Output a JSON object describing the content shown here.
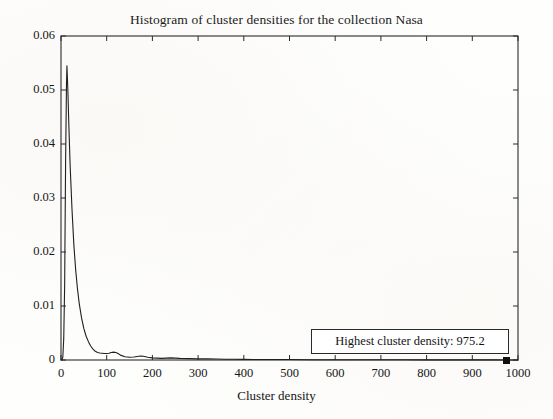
{
  "figure": {
    "title": "Histogram of cluster densities for the collection Nasa",
    "background_color": "#ffffff",
    "axis_color": "#2a2a2a",
    "curve_color": "#1f1f1f"
  },
  "annotation": {
    "text": "Highest cluster density: 975.2",
    "marker_name": "highest-density-marker",
    "marker_x": 975.2,
    "marker_y": 0
  },
  "axes": {
    "x": {
      "label": "Cluster density",
      "min": 0,
      "max": 1000,
      "ticks": [
        0,
        100,
        200,
        300,
        400,
        500,
        600,
        700,
        800,
        900,
        1000
      ],
      "tick_labels": [
        "0",
        "100",
        "200",
        "300",
        "400",
        "500",
        "600",
        "700",
        "800",
        "900",
        "1000"
      ]
    },
    "y": {
      "label": "",
      "min": 0,
      "max": 0.06,
      "ticks": [
        0,
        0.01,
        0.02,
        0.03,
        0.04,
        0.05,
        0.06
      ],
      "tick_labels": [
        "0",
        "0.01",
        "0.02",
        "0.03",
        "0.04",
        "0.05",
        "0.06"
      ]
    },
    "grid": false,
    "legend": "none"
  },
  "chart_data": {
    "type": "line",
    "title": "Histogram of cluster densities for the collection Nasa",
    "xlabel": "Cluster density",
    "ylabel": "",
    "xlim": [
      0,
      1000
    ],
    "ylim": [
      0,
      0.06
    ],
    "grid": false,
    "legend_position": "none",
    "annotations": [
      {
        "text": "Highest cluster density: 975.2",
        "x": 975.2,
        "y": 0,
        "marker": "filled-square"
      }
    ],
    "series": [
      {
        "name": "Cluster density distribution",
        "x": [
          0,
          2,
          4,
          6,
          8,
          10,
          12,
          13,
          15,
          17,
          20,
          24,
          28,
          32,
          36,
          40,
          45,
          50,
          55,
          60,
          65,
          70,
          75,
          80,
          85,
          90,
          95,
          100,
          105,
          110,
          115,
          120,
          125,
          130,
          140,
          150,
          160,
          170,
          175,
          180,
          190,
          200,
          210,
          220,
          230,
          240,
          250,
          260,
          280,
          300,
          320,
          340,
          360,
          380,
          400,
          420,
          440,
          460,
          480,
          500,
          550,
          600,
          650,
          700,
          750,
          800,
          850,
          900,
          950,
          975.2,
          1000
        ],
        "y": [
          0.0,
          0.0,
          0.0005,
          0.004,
          0.014,
          0.036,
          0.051,
          0.0545,
          0.05,
          0.044,
          0.036,
          0.028,
          0.0215,
          0.0168,
          0.0132,
          0.0104,
          0.0078,
          0.0058,
          0.0044,
          0.0034,
          0.0026,
          0.002,
          0.0016,
          0.0014,
          0.0013,
          0.00125,
          0.0012,
          0.0012,
          0.00125,
          0.0014,
          0.00145,
          0.0014,
          0.0012,
          0.0009,
          0.0006,
          0.0005,
          0.00055,
          0.0007,
          0.00075,
          0.0007,
          0.0005,
          0.0004,
          0.00035,
          0.0003,
          0.00035,
          0.0004,
          0.00035,
          0.0003,
          0.00025,
          0.0002,
          0.0002,
          0.00018,
          0.00015,
          0.00015,
          0.00012,
          0.0001,
          0.0001,
          0.0001,
          8e-05,
          8e-05,
          6e-05,
          5e-05,
          5e-05,
          4e-05,
          4e-05,
          3e-05,
          3e-05,
          2e-05,
          2e-05,
          0.0,
          0.0
        ]
      }
    ]
  }
}
